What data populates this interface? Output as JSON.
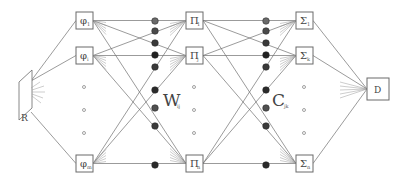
{
  "diagram": {
    "type": "neural-network-schematic",
    "input": {
      "label": "R",
      "name": "retina"
    },
    "layer1": {
      "symbol": "φ",
      "nodes": [
        {
          "sym": "φ",
          "sub": "1",
          "y": 12
        },
        {
          "sym": "φ",
          "sub": "i",
          "y": 47
        },
        {
          "sym": "φ",
          "sub": "m",
          "y": 155
        }
      ]
    },
    "weights1": {
      "label": "W",
      "sub": "ij"
    },
    "layer2": {
      "symbol": "Π",
      "nodes": [
        {
          "sym": "Π",
          "sub": "1",
          "y": 12
        },
        {
          "sym": "Π",
          "sub": "j",
          "y": 47
        },
        {
          "sym": "Π",
          "sub": "n",
          "y": 155
        }
      ]
    },
    "weights2": {
      "label": "C",
      "sub": "jk"
    },
    "layer3": {
      "symbol": "Σ",
      "nodes": [
        {
          "sym": "Σ",
          "sub": "1",
          "y": 12
        },
        {
          "sym": "Σ",
          "sub": "k",
          "y": 47
        },
        {
          "sym": "Σ",
          "sub": "n",
          "y": 155
        }
      ]
    },
    "output": {
      "label": "D"
    },
    "colors": {
      "line": "#707070",
      "box": "#6a6a6a",
      "weight_dark": "#2a2a2a",
      "weight_mid": "#555555",
      "weight_light": "#7a7a7a"
    },
    "weight_circles_y": [
      21,
      31,
      43,
      55,
      67,
      90,
      108,
      126,
      165
    ],
    "weight_shades": [
      "#6a6a6a",
      "#4a4a4a",
      "#3a3a3a",
      "#222222",
      "#3a3a3a",
      "#2a2a2a",
      "#505050",
      "#3a3a3a",
      "#2a2a2a"
    ]
  }
}
